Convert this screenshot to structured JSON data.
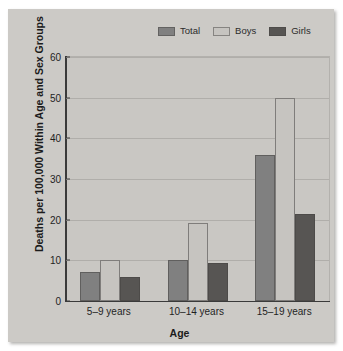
{
  "chart_data": {
    "type": "bar",
    "title": "",
    "xlabel": "Age",
    "ylabel": "Deaths per 100,000 Within Age and Sex Groups",
    "categories": [
      "5–9 years",
      "10–14 years",
      "15–19 years"
    ],
    "series": [
      {
        "name": "Total",
        "color": "#808080",
        "values": [
          7.2,
          10.0,
          36.0
        ]
      },
      {
        "name": "Boys",
        "color": "#c6c4c0",
        "values": [
          10.0,
          19.2,
          50.0
        ]
      },
      {
        "name": "Girls",
        "color": "#575553",
        "values": [
          5.8,
          9.3,
          21.3
        ]
      }
    ],
    "ylim": [
      0,
      60
    ],
    "yticks": [
      0,
      10,
      20,
      30,
      40,
      50,
      60
    ],
    "ytick_labels": [
      "0",
      "10",
      "20",
      "30",
      "40",
      "50",
      "60"
    ],
    "grid": true,
    "legend_position": "top-right",
    "plot_background": "#c9c7c3",
    "panel_background": "#cccac6"
  }
}
